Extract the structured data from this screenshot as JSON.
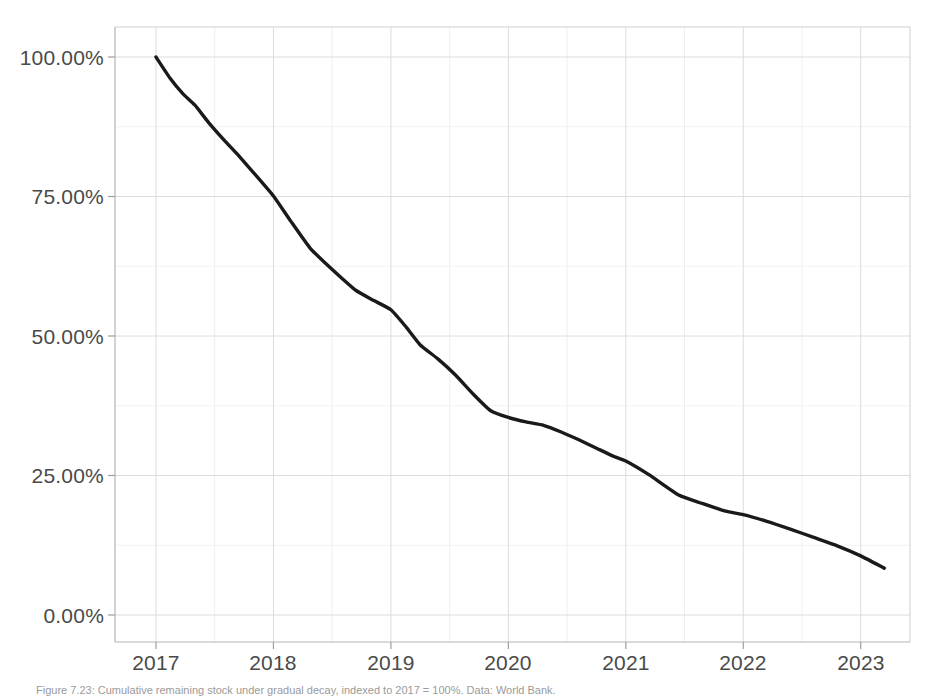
{
  "figure": {
    "caption": "Figure 7.23: Cumulative remaining stock under gradual decay, indexed to 2017 = 100%. Data: World Bank."
  },
  "axes": {
    "y_tick_labels": [
      "100.00%",
      "75.00%",
      "50.00%",
      "25.00%",
      "0.00%"
    ],
    "x_tick_labels": [
      "2017",
      "2018",
      "2019",
      "2020",
      "2021",
      "2022",
      "2023"
    ]
  },
  "chart_data": {
    "type": "line",
    "title": "",
    "xlabel": "",
    "ylabel": "",
    "xlim": [
      2016.65,
      2023.6
    ],
    "ylim": [
      -5,
      105
    ],
    "grid": true,
    "legend": null,
    "line_color": "#1a1a1a",
    "line_width": 3.4,
    "x_ticks": [
      2017,
      2018,
      2019,
      2020,
      2021,
      2022,
      2023
    ],
    "y_ticks": [
      0,
      25,
      50,
      75,
      100
    ],
    "y_tick_format": "percent_2dp",
    "series": [
      {
        "name": "Cumulative remaining (indexed to 2017)",
        "x": [
          2017.0,
          2017.12,
          2017.23,
          2017.33,
          2017.45,
          2017.58,
          2017.7,
          2017.83,
          2018.0,
          2018.15,
          2018.31,
          2018.45,
          2018.58,
          2018.7,
          2018.85,
          2019.0,
          2019.13,
          2019.25,
          2019.4,
          2019.55,
          2019.7,
          2019.85,
          2020.0,
          2020.15,
          2020.3,
          2020.45,
          2020.6,
          2020.75,
          2020.9,
          2021.0,
          2021.2,
          2021.45,
          2021.65,
          2021.85,
          2022.0,
          2022.2,
          2022.4,
          2022.6,
          2022.8,
          2023.0,
          2023.2
        ],
        "y": [
          100.0,
          96.2,
          93.4,
          91.4,
          88.2,
          85.1,
          82.4,
          79.3,
          75.1,
          70.5,
          65.8,
          62.9,
          60.4,
          58.2,
          56.4,
          54.7,
          51.6,
          48.4,
          45.9,
          43.0,
          39.6,
          36.6,
          35.4,
          34.6,
          34.0,
          32.8,
          31.4,
          29.9,
          28.4,
          27.6,
          25.1,
          21.5,
          20.0,
          18.6,
          18.0,
          16.8,
          15.4,
          13.9,
          12.4,
          10.6,
          8.4
        ]
      }
    ]
  }
}
